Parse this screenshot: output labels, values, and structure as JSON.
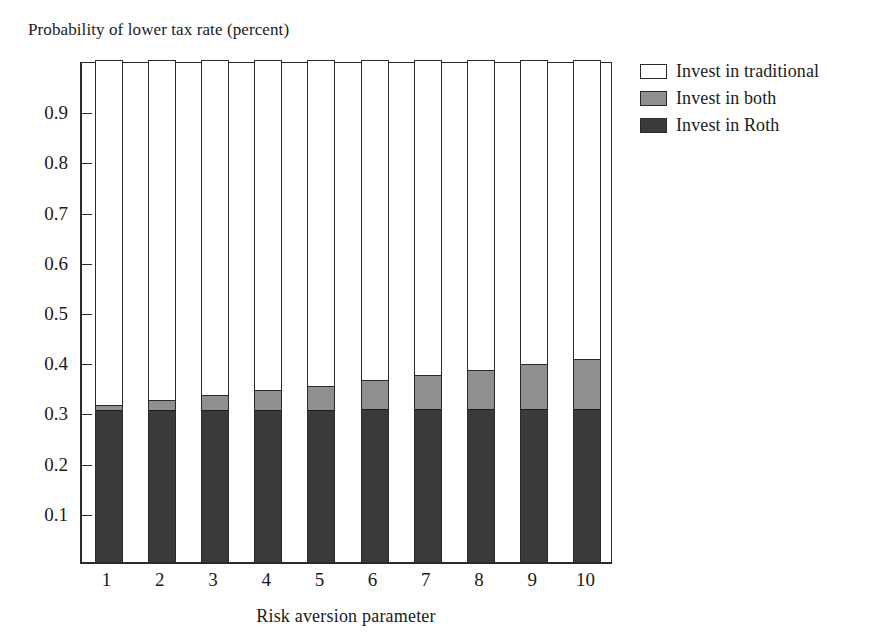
{
  "figure": {
    "clipped_caption_above": "",
    "background": "#ffffff"
  },
  "axes": {
    "y_title": "Probability of lower tax rate (percent)",
    "x_title": "Risk aversion parameter",
    "y_ticks": [
      "0.9",
      "0.8",
      "0.7",
      "0.6",
      "0.5",
      "0.4",
      "0.3",
      "0.2",
      "0.1"
    ],
    "x_ticks": [
      "1",
      "2",
      "3",
      "4",
      "5",
      "6",
      "7",
      "8",
      "9",
      "10"
    ]
  },
  "legend": {
    "position": "right",
    "items": [
      {
        "label": "Invest in traditional",
        "color": "#ffffff",
        "key": "traditional"
      },
      {
        "label": "Invest in both",
        "color": "#8f8f8f",
        "key": "both"
      },
      {
        "label": "Invest in Roth",
        "color": "#3a3a3a",
        "key": "roth"
      }
    ]
  },
  "colors": {
    "traditional": "#ffffff",
    "both": "#8f8f8f",
    "roth": "#3a3a3a",
    "axis": "#2a2a2a",
    "text": "#1a1a1a"
  },
  "chart_data": {
    "type": "bar",
    "stacked": true,
    "title": "",
    "xlabel": "Risk aversion parameter",
    "ylabel": "Probability of lower tax rate (percent)",
    "categories": [
      "1",
      "2",
      "3",
      "4",
      "5",
      "6",
      "7",
      "8",
      "9",
      "10"
    ],
    "ylim": [
      0,
      1
    ],
    "xlim_note": "10 categories, equal width bars with gaps",
    "grid": false,
    "legend_position": "right",
    "series": [
      {
        "name": "Invest in Roth",
        "color": "#3a3a3a",
        "values": [
          0.302,
          0.302,
          0.303,
          0.303,
          0.303,
          0.304,
          0.304,
          0.304,
          0.305,
          0.305
        ]
      },
      {
        "name": "Invest in both",
        "color": "#8f8f8f",
        "values": [
          0.01,
          0.02,
          0.03,
          0.04,
          0.048,
          0.058,
          0.068,
          0.079,
          0.089,
          0.1
        ]
      },
      {
        "name": "Invest in traditional",
        "color": "#ffffff",
        "values": [
          0.688,
          0.678,
          0.667,
          0.657,
          0.649,
          0.638,
          0.628,
          0.617,
          0.606,
          0.595
        ]
      }
    ],
    "cumulative_tops": {
      "roth": [
        0.302,
        0.302,
        0.303,
        0.303,
        0.303,
        0.304,
        0.304,
        0.304,
        0.305,
        0.305
      ],
      "roth_plus_both": [
        0.312,
        0.322,
        0.333,
        0.343,
        0.351,
        0.362,
        0.372,
        0.383,
        0.394,
        0.405
      ]
    }
  }
}
